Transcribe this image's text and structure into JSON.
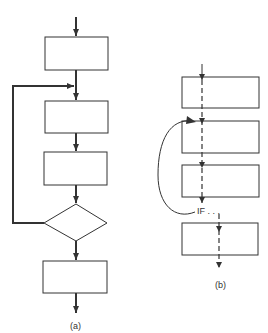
{
  "diagram_a": {
    "label": "(a)",
    "nodes": [
      {
        "id": "box1",
        "shape": "rect"
      },
      {
        "id": "box2",
        "shape": "rect"
      },
      {
        "id": "box3",
        "shape": "rect"
      },
      {
        "id": "decision",
        "shape": "diamond"
      },
      {
        "id": "box5",
        "shape": "rect"
      }
    ],
    "edges": [
      {
        "from": "start",
        "to": "box1"
      },
      {
        "from": "box1",
        "to": "box2"
      },
      {
        "from": "box2",
        "to": "box3"
      },
      {
        "from": "box3",
        "to": "decision"
      },
      {
        "from": "decision",
        "to": "box2",
        "type": "loop-back"
      },
      {
        "from": "decision",
        "to": "box5"
      },
      {
        "from": "box5",
        "to": "end"
      }
    ]
  },
  "diagram_b": {
    "label": "(b)",
    "condition_label": "IF . . .",
    "nodes": [
      {
        "id": "box1",
        "shape": "rect"
      },
      {
        "id": "box2",
        "shape": "rect"
      },
      {
        "id": "box3",
        "shape": "rect"
      },
      {
        "id": "box4",
        "shape": "rect"
      }
    ],
    "edges": [
      {
        "from": "start",
        "to": "box4",
        "style": "dashed-through"
      },
      {
        "from": "if",
        "to": "box2",
        "type": "curved-jump-back"
      }
    ]
  },
  "colors": {
    "stroke": "#333333",
    "background": "#ffffff"
  }
}
